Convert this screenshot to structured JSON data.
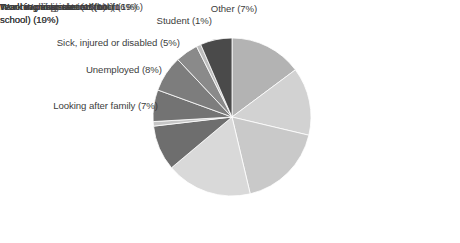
{
  "chart_data": {
    "type": "pie",
    "title": "",
    "subtitle": "",
    "legend_position": "labels-around-pie",
    "grid": false,
    "unit": "%",
    "total": 108,
    "categories": [
      "Teaching in private school",
      "Teaching assistant",
      "Non-teaching role in school",
      "Work in public sector (not in school)",
      "Work in private sector (not in school)",
      "Working abroad",
      "Looking after family",
      "Unemployed",
      "Sick, injured or disabled",
      "Student",
      "Other"
    ],
    "values": [
      16,
      15,
      19,
      19,
      10,
      1,
      7,
      8,
      5,
      1,
      7
    ],
    "labels": [
      "Teaching in private school (16%)",
      "Teaching assistant (15%)",
      "Non-teaching role in school (19%)",
      "Work in public sector (not in\nschool) (19%)",
      "Work in private sector (not in\nschool) (10%)",
      "Working abroad (1%)",
      "Looking after family (7%)",
      "Unemployed (8%)",
      "Sick, injured or disabled (5%)",
      "Student (1%)",
      "Other (7%)"
    ],
    "colors": [
      "#b3b3b3",
      "#d2d2d2",
      "#c9c9c9",
      "#d9d9d9",
      "#6e6e6e",
      "#c6c6c6",
      "#737373",
      "#7d7d7d",
      "#8a8a8a",
      "#bdbdbd",
      "#4a4a4a"
    ],
    "start_angle_deg": 0,
    "direction": "clockwise",
    "xlabel": "",
    "ylabel": ""
  },
  "geometry": {
    "center_x": 232,
    "center_y": 117,
    "radius": 79
  }
}
